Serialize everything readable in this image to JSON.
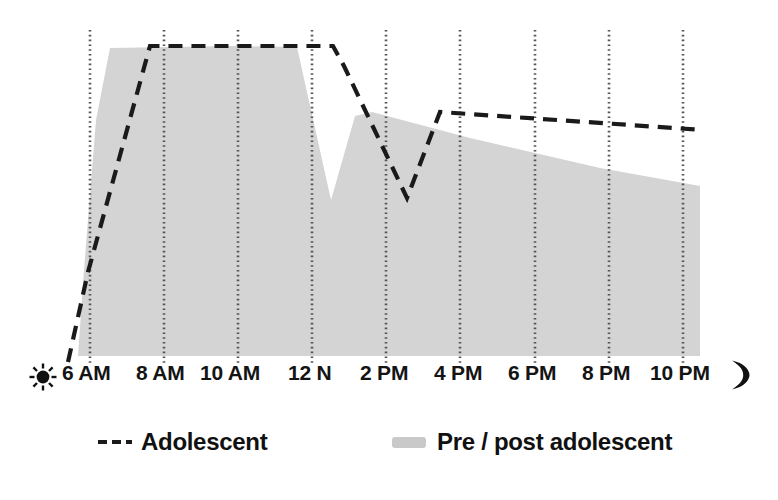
{
  "chart_data": {
    "type": "area",
    "title": "",
    "subtitle": "",
    "xlabel": "",
    "ylabel": "",
    "grid": true,
    "grid_orientation": "vertical",
    "legend_position": "bottom",
    "xlim": [
      "5:30 AM",
      "11:00 PM"
    ],
    "ylim": [
      0,
      100
    ],
    "x_tick_labels": [
      "6 AM",
      "8 AM",
      "10 AM",
      "12 N",
      "2 PM",
      "4 PM",
      "6 PM",
      "8 PM",
      "10 PM"
    ],
    "x_tick_positions": [
      90,
      164,
      238,
      312,
      386,
      460,
      535,
      609,
      683
    ],
    "axis_start_icon": "sun-icon",
    "axis_end_icon": "moon-icon",
    "colors": {
      "area_fill": "#d4d4d4",
      "line": "#1a1a1a",
      "gridline": "#555555",
      "background": "#ffffff"
    },
    "series": [
      {
        "name": "Pre / post adolescent",
        "style": "filled-area",
        "color": "#d4d4d4",
        "points": [
          {
            "x": 78,
            "y": 356
          },
          {
            "x": 84,
            "y": 270
          },
          {
            "x": 96,
            "y": 120
          },
          {
            "x": 110,
            "y": 48
          },
          {
            "x": 230,
            "y": 46
          },
          {
            "x": 297,
            "y": 47
          },
          {
            "x": 331,
            "y": 200
          },
          {
            "x": 355,
            "y": 116
          },
          {
            "x": 372,
            "y": 112
          },
          {
            "x": 470,
            "y": 138
          },
          {
            "x": 600,
            "y": 168
          },
          {
            "x": 700,
            "y": 186
          },
          {
            "x": 700,
            "y": 356
          },
          {
            "x": 78,
            "y": 356
          }
        ]
      },
      {
        "name": "Adolescent",
        "style": "dashed-line",
        "color": "#1a1a1a",
        "points": [
          {
            "x": 68,
            "y": 362
          },
          {
            "x": 88,
            "y": 272
          },
          {
            "x": 150,
            "y": 46
          },
          {
            "x": 333,
            "y": 46
          },
          {
            "x": 344,
            "y": 66
          },
          {
            "x": 407,
            "y": 198
          },
          {
            "x": 440,
            "y": 112
          },
          {
            "x": 703,
            "y": 130
          }
        ]
      }
    ],
    "legend": [
      {
        "label": "Adolescent",
        "marker": "dashed-line"
      },
      {
        "label": "Pre / post adolescent",
        "marker": "filled-bar"
      }
    ]
  },
  "axis": {
    "ticks": [
      {
        "label": "6 AM",
        "left": 62
      },
      {
        "label": "8 AM",
        "left": 136
      },
      {
        "label": "10 AM",
        "left": 200
      },
      {
        "label": "12 N",
        "left": 288
      },
      {
        "label": "2 PM",
        "left": 360
      },
      {
        "label": "4 PM",
        "left": 434
      },
      {
        "label": "6 PM",
        "left": 508
      },
      {
        "label": "8 PM",
        "left": 582
      },
      {
        "label": "10 PM",
        "left": 650
      }
    ],
    "start_icon_name": "sun-icon",
    "end_icon_name": "moon-icon"
  },
  "legend": {
    "adolescent_label": "Adolescent",
    "pre_post_label": "Pre / post adolescent"
  }
}
